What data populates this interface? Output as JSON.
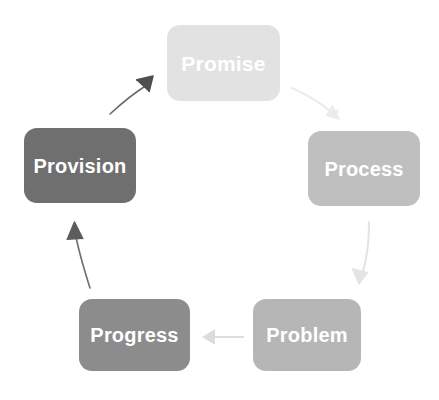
{
  "diagram": {
    "type": "cycle",
    "background_color": "#ffffff",
    "label_text_color": "#ffffff",
    "nodes": [
      {
        "id": "promise",
        "label": "Promise",
        "color": "#e2e2e2",
        "position": "top",
        "order": 1
      },
      {
        "id": "process",
        "label": "Process",
        "color": "#bfbfbf",
        "position": "right",
        "order": 2
      },
      {
        "id": "problem",
        "label": "Problem",
        "color": "#b6b6b6",
        "position": "bottom-right",
        "order": 3
      },
      {
        "id": "progress",
        "label": "Progress",
        "color": "#8c8c8c",
        "position": "bottom-left",
        "order": 4
      },
      {
        "id": "provision",
        "label": "Provision",
        "color": "#6f6f6f",
        "position": "left",
        "order": 5
      }
    ],
    "connectors": [
      {
        "id": "promise-to-process",
        "from": "promise",
        "to": "process",
        "color": "#ededed",
        "direction": "down-right"
      },
      {
        "id": "process-to-problem",
        "from": "process",
        "to": "problem",
        "color": "#e4e4e4",
        "direction": "down"
      },
      {
        "id": "problem-to-progress",
        "from": "problem",
        "to": "progress",
        "color": "#dcdcdc",
        "direction": "left"
      },
      {
        "id": "progress-to-provision",
        "from": "progress",
        "to": "provision",
        "color": "#6a6a6a",
        "direction": "up"
      },
      {
        "id": "provision-to-promise",
        "from": "provision",
        "to": "promise",
        "color": "#4f4f4f",
        "direction": "up-right"
      }
    ]
  }
}
